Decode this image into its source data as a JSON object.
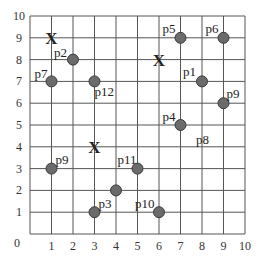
{
  "chart_data": {
    "type": "scatter",
    "title": "",
    "xlabel": "",
    "ylabel": "",
    "xlim": [
      0,
      10
    ],
    "ylim": [
      0,
      10
    ],
    "grid": true,
    "x_ticks": [
      "0",
      "1",
      "2",
      "3",
      "4",
      "5",
      "6",
      "7",
      "8",
      "9",
      "10"
    ],
    "y_ticks": [
      "1",
      "2",
      "3",
      "4",
      "5",
      "6",
      "7",
      "8",
      "9",
      "10"
    ],
    "origin_label": "0",
    "points": [
      {
        "label": "p1",
        "x": 8,
        "y": 7,
        "lx": -19,
        "ly": -5
      },
      {
        "label": "p2",
        "x": 2,
        "y": 8,
        "lx": -19,
        "ly": -3
      },
      {
        "label": "p3",
        "x": 3,
        "y": 1,
        "lx": 4,
        "ly": -4
      },
      {
        "label": "p4",
        "x": 7,
        "y": 5,
        "lx": -18,
        "ly": -4
      },
      {
        "label": "p5",
        "x": 7,
        "y": 9,
        "lx": -18,
        "ly": -5
      },
      {
        "label": "p6",
        "x": 9,
        "y": 9,
        "lx": -18,
        "ly": -5
      },
      {
        "label": "p7",
        "x": 1,
        "y": 7,
        "lx": -17,
        "ly": -3
      },
      {
        "label": "p9",
        "x": 9,
        "y": 6,
        "lx": 3,
        "ly": -5
      },
      {
        "label": "p9",
        "x": 1,
        "y": 3,
        "lx": 4,
        "ly": -5
      },
      {
        "label": "p10",
        "x": 6,
        "y": 1,
        "lx": -24,
        "ly": -4
      },
      {
        "label": "p11",
        "x": 5,
        "y": 3,
        "lx": -20,
        "ly": -5
      },
      {
        "label": "p12",
        "x": 3,
        "y": 7,
        "lx": 0,
        "ly": 15
      },
      {
        "label": "",
        "x": 4,
        "y": 2,
        "lx": 0,
        "ly": 0
      }
    ],
    "text_labels": [
      {
        "label": "p8",
        "x": 8,
        "y": 4.3
      }
    ],
    "x_markers": [
      {
        "label": "X",
        "x": 1,
        "y": 9
      },
      {
        "label": "X",
        "x": 6,
        "y": 8
      },
      {
        "label": "X",
        "x": 3,
        "y": 4
      }
    ],
    "colors": {
      "grid": "#555555",
      "point_fill": "#6b6b6b",
      "point_stroke": "#3a3a3a",
      "text": "#222222"
    }
  }
}
